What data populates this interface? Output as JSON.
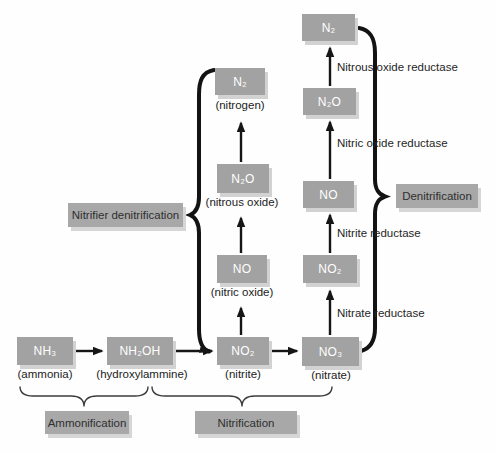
{
  "diagram_name": "Nitrogen cycle pathways",
  "colors": {
    "background": "#fefefe",
    "box_fill": "#a2a2a2",
    "box_shadow": "#d2d2d2",
    "box_text": "#ffffff",
    "arrow": "#161616",
    "label_text": "#262626"
  },
  "nodes": {
    "nh3": {
      "formula": "NH₃",
      "caption": "(ammonia)"
    },
    "nh2oh": {
      "formula": "NH₂OH",
      "caption": "(hydroxylammine)"
    },
    "no2_nitrite": {
      "formula": "NO₂",
      "caption": "(nitrite)"
    },
    "no3_nitrate": {
      "formula": "NO₃",
      "caption": "(nitrate)"
    },
    "no_mid": {
      "formula": "NO",
      "caption": "(nitric oxide)"
    },
    "n2o_mid": {
      "formula": "N₂O",
      "caption": "(nitrous oxide)"
    },
    "n2_mid": {
      "formula": "N₂",
      "caption": "(nitrogen)"
    },
    "no2_right": {
      "formula": "NO₂"
    },
    "no_right": {
      "formula": "NO"
    },
    "n2o_right": {
      "formula": "N₂O"
    },
    "n2_right": {
      "formula": "N₂"
    }
  },
  "enzymes": {
    "nitrous_oxide_reductase": "Nitrous oxide reductase",
    "nitric_oxide_reductase": "Nitric oxide reductase",
    "nitrite_reductase": "Nitrite reductase",
    "nitrate_reductase": "Nitrate reductase"
  },
  "processes": {
    "nitrifier_denitrification": "Nitrifier denitrification",
    "denitrification": "Denitrification",
    "ammonification": "Ammonification",
    "nitrification": "Nitrification"
  }
}
